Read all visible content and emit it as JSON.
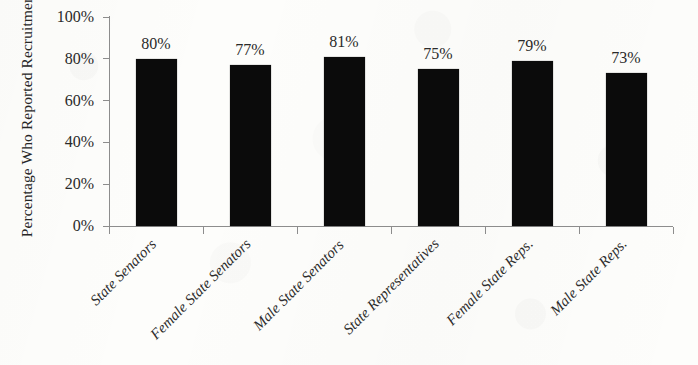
{
  "chart_data": {
    "type": "bar",
    "title": "",
    "xlabel": "",
    "ylabel": "Percentage Who Reported Recruitment",
    "categories": [
      "State Senators",
      "Female State Senators",
      "Male State Senators",
      "State Representatives",
      "Female State Reps.",
      "Male State Reps."
    ],
    "values": [
      80,
      77,
      81,
      75,
      79,
      73
    ],
    "value_labels": [
      "80%",
      "77%",
      "81%",
      "75%",
      "79%",
      "73%"
    ],
    "ylim": [
      0,
      100
    ],
    "y_ticks": [
      0,
      20,
      40,
      60,
      80,
      100
    ],
    "y_tick_labels": [
      "0%",
      "20%",
      "40%",
      "60%",
      "80%",
      "100%"
    ],
    "grid": false,
    "legend": null,
    "bar_color": "#0b0b0b",
    "background_color": "#fdfdfb",
    "axis_color": "#8d8d8d"
  }
}
